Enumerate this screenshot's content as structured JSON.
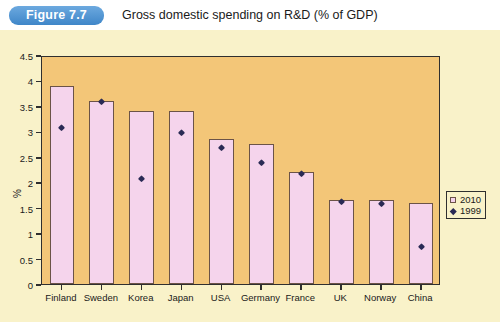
{
  "header": {
    "badge_label": "Figure 7.7",
    "title": "Gross domestic spending on R&D (% of GDP)"
  },
  "legend": {
    "position": "right-middle",
    "entries": [
      {
        "label": "2010",
        "marker": "square",
        "color": "#f5d4ec"
      },
      {
        "label": "1999",
        "marker": "diamond",
        "color": "#2a2a55"
      }
    ]
  },
  "colors": {
    "page_background": "#fdfdfb",
    "figure_background": "#f9f2c9",
    "plot_background": "#f3c678",
    "bar_fill": "#f5d4ec",
    "bar_border": "#6b5347",
    "marker": "#2a2a55",
    "axis": "#2f2f2f",
    "badge_blue": "#3f86c8"
  },
  "chart_data": {
    "type": "bar",
    "title": "Gross domestic spending on R&D (% of GDP)",
    "xlabel": "",
    "ylabel": "%",
    "ylim": [
      0,
      4.5
    ],
    "yticks": [
      0,
      0.5,
      1,
      1.5,
      2,
      2.5,
      3,
      3.5,
      4,
      4.5
    ],
    "ytick_labels": [
      "0",
      "0.5",
      "1",
      "1.5",
      "2",
      "2.5",
      "3",
      "3.5",
      "4",
      "4.5"
    ],
    "grid": false,
    "legend_position": "right",
    "categories": [
      "Finland",
      "Sweden",
      "Korea",
      "Japan",
      "USA",
      "Germany",
      "France",
      "UK",
      "Norway",
      "China"
    ],
    "series": [
      {
        "name": "2010",
        "marker": "bar",
        "values": [
          3.9,
          3.6,
          3.4,
          3.4,
          2.85,
          2.75,
          2.2,
          1.65,
          1.65,
          1.6
        ]
      },
      {
        "name": "1999",
        "marker": "diamond",
        "values": [
          3.1,
          3.6,
          2.1,
          3.0,
          2.7,
          2.4,
          2.2,
          1.65,
          1.6,
          0.75
        ]
      }
    ]
  }
}
